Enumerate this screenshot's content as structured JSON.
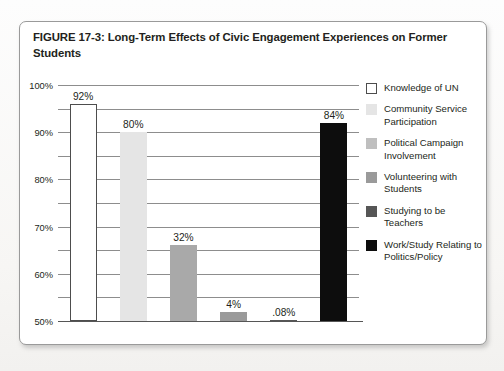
{
  "figure": {
    "title": "FIGURE 17-3: Long-Term Effects of Civic Engagement Experiences on Former Students"
  },
  "chart_data": {
    "type": "bar",
    "title": "FIGURE 17-3: Long-Term Effects of Civic Engagement Experiences on Former Students",
    "xlabel": "",
    "ylabel": "",
    "ylim": [
      0,
      100
    ],
    "ytick_labels": [
      "100%",
      "90%",
      "80%",
      "70%",
      "60%",
      "50%",
      "40%",
      "30%",
      "20%",
      "10%",
      "0%"
    ],
    "ytick_values": [
      100,
      90,
      80,
      70,
      60,
      50,
      40,
      30,
      20,
      10,
      0
    ],
    "grid": true,
    "legend_position": "right",
    "categories": [
      "Knowledge of UN",
      "Community Service Participation",
      "Political Campaign Involvement",
      "Volunteering with Students",
      "Studying to be Teachers",
      "Work/Study Relating to Politics/Policy"
    ],
    "values": [
      92,
      80,
      32,
      4,
      0.08,
      84
    ],
    "data_labels": [
      "92%",
      "80%",
      "32%",
      "4%",
      ".08%",
      "84%"
    ],
    "colors": [
      "#ffffff",
      "#e5e5e5",
      "#a9a9a9",
      "#9a9a9a",
      "#565656",
      "#0d0d0d"
    ]
  },
  "legend": {
    "items": [
      {
        "label": "Knowledge of UN",
        "color": "#ffffff"
      },
      {
        "label": "Community Service Participation",
        "color": "#e5e5e5"
      },
      {
        "label": "Political Campaign Involvement",
        "color": "#bfbfbf"
      },
      {
        "label": "Volunteering with Students",
        "color": "#9a9a9a"
      },
      {
        "label": "Studying to be Teachers",
        "color": "#565656"
      },
      {
        "label": "Work/Study Relating to Politics/Policy",
        "color": "#0d0d0d"
      }
    ]
  }
}
